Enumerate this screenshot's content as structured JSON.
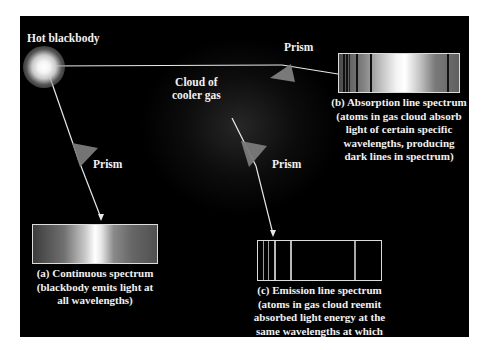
{
  "labels": {
    "source": "Hot blackbody",
    "cloud_line1": "Cloud of",
    "cloud_line2": "cooler gas",
    "prism_top": "Prism",
    "prism_left": "Prism",
    "prism_mid": "Prism"
  },
  "spectra": {
    "continuous": {
      "caption": [
        "(a) Continuous spectrum",
        "(blackbody emits light at",
        "all wavelengths)"
      ]
    },
    "absorption": {
      "caption": [
        "(b) Absorption line spectrum",
        "(atoms in gas cloud absorb",
        "light of certain specific",
        "wavelengths, producing",
        "dark lines in spectrum)"
      ],
      "dark_lines_px": [
        4,
        7,
        10,
        17,
        31,
        108
      ]
    },
    "emission": {
      "caption": [
        "(c) Emission line spectrum",
        "(atoms in gas cloud reemit",
        "absorbed light energy at the",
        "same wavelengths at which",
        "they absorbed it)"
      ],
      "bright_lines_px": [
        5,
        10,
        17,
        33,
        96
      ]
    }
  },
  "colors": {
    "background": "#000000",
    "page": "#ffffff",
    "text": "#f2f2f2",
    "ray": "#e8e8e8",
    "prism": "#7a7a7a"
  }
}
